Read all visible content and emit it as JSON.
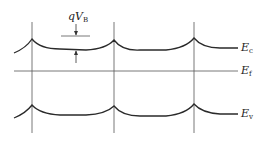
{
  "diagram": {
    "type": "band-diagram",
    "labels": {
      "conduction_band": {
        "base": "E",
        "sub": "c"
      },
      "fermi_level": {
        "base": "E",
        "sub": "f"
      },
      "valence_band": {
        "base": "E",
        "sub": "v"
      },
      "barrier_height": {
        "base": "qV",
        "sub": "B"
      }
    },
    "grain_boundaries_x": [
      32,
      114,
      194
    ],
    "colors": {
      "line": "#2a2a2a",
      "thin": "#555555"
    }
  }
}
